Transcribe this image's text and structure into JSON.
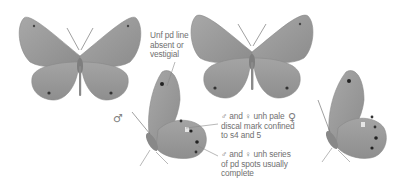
{
  "figure": {
    "specimens": [
      {
        "id": "male-upperside",
        "view": "upperside",
        "sex": "male"
      },
      {
        "id": "female-upperside",
        "view": "upperside",
        "sex": "female"
      },
      {
        "id": "male-underside",
        "view": "underside",
        "sex": "male"
      },
      {
        "id": "female-underside",
        "view": "underside",
        "sex": "female"
      }
    ],
    "annotations": {
      "unf_pd_line": "Unf pd line absent or vestigial",
      "unf_pd_line_lines": [
        "Unf pd line",
        "absent or",
        "vestigial"
      ],
      "discal_mark_lines": [
        "♂ and ♀ unh pale",
        "discal mark confined",
        "to s4 and 5"
      ],
      "pd_spots_lines": [
        "♂ and ♀ unh series",
        "of pd spots usually",
        "complete"
      ]
    },
    "sex_symbols": {
      "male": "♂",
      "female": "♀"
    },
    "colors": {
      "wing": "#9a9a9a",
      "wing_dark": "#7a7a7a",
      "label_text": "#707070",
      "background": "#ffffff"
    }
  }
}
